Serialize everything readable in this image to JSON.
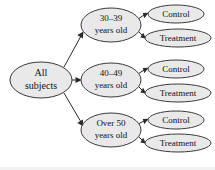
{
  "diagram": {
    "type": "tree",
    "title": "",
    "background_color": "#ffffff",
    "node_fill_color": "#e9e9e9",
    "node_border_color": "#3a3a3a",
    "edge_color": "#2b2b2b",
    "text_color": "#111111",
    "root": {
      "id": "all-subjects",
      "line1": "All",
      "line2": "subjects",
      "cx": 41,
      "cy": 80,
      "rx": 31,
      "ry": 18,
      "font_size": 10
    },
    "groups": [
      {
        "id": "age-30-39",
        "line1": "30–39",
        "line2": "years old",
        "cx": 111,
        "cy": 25,
        "rx": 30,
        "ry": 17,
        "font_size": 9,
        "children": [
          {
            "id": "control-30-39",
            "label": "Control",
            "cx": 176,
            "cy": 14,
            "rx": 28,
            "ry": 9,
            "font_size": 9
          },
          {
            "id": "treatment-30-39",
            "label": "Treatment",
            "cx": 178,
            "cy": 38,
            "rx": 33,
            "ry": 9,
            "font_size": 9
          }
        ]
      },
      {
        "id": "age-40-49",
        "line1": "40–49",
        "line2": "years old",
        "cx": 111,
        "cy": 80,
        "rx": 30,
        "ry": 17,
        "font_size": 9,
        "children": [
          {
            "id": "control-40-49",
            "label": "Control",
            "cx": 176,
            "cy": 69,
            "rx": 28,
            "ry": 9,
            "font_size": 9
          },
          {
            "id": "treatment-40-49",
            "label": "Treatment",
            "cx": 178,
            "cy": 93,
            "rx": 33,
            "ry": 9,
            "font_size": 9
          }
        ]
      },
      {
        "id": "age-over-50",
        "line1": "Over 50",
        "line2": "years old",
        "cx": 111,
        "cy": 130,
        "rx": 30,
        "ry": 17,
        "font_size": 9,
        "children": [
          {
            "id": "control-over-50",
            "label": "Control",
            "cx": 176,
            "cy": 120,
            "rx": 28,
            "ry": 9,
            "font_size": 9
          },
          {
            "id": "treatment-over-50",
            "label": "Treatment",
            "cx": 178,
            "cy": 143,
            "rx": 33,
            "ry": 9,
            "font_size": 9
          }
        ]
      }
    ]
  }
}
